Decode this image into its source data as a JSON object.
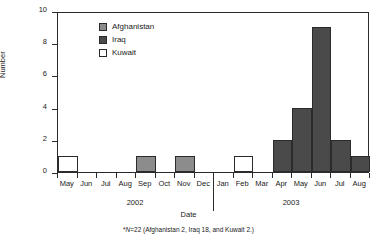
{
  "chart_data": {
    "type": "bar",
    "title": "",
    "xlabel": "Date",
    "ylabel": "Number",
    "ylim": [
      0,
      10
    ],
    "yticks": [
      0,
      2,
      4,
      6,
      8,
      10
    ],
    "grid": false,
    "legend_position": "inside-top-left",
    "categories": [
      "May",
      "Jun",
      "Jul",
      "Aug",
      "Sep",
      "Oct",
      "Nov",
      "Dec",
      "Jan",
      "Feb",
      "Mar",
      "Apr",
      "May",
      "Jun",
      "Jul",
      "Aug"
    ],
    "group_labels": [
      "2002",
      "2003"
    ],
    "series": [
      {
        "name": "Afghanistan",
        "color": "#8c8c8c",
        "values": [
          0,
          0,
          0,
          0,
          1,
          0,
          1,
          0,
          0,
          0,
          0,
          0,
          0,
          0,
          0,
          0
        ]
      },
      {
        "name": "Iraq",
        "color": "#4a4a4a",
        "values": [
          0,
          0,
          0,
          0,
          0,
          0,
          0,
          0,
          0,
          0,
          0,
          2,
          4,
          9,
          2,
          1
        ]
      },
      {
        "name": "Kuwait",
        "color": "#ffffff",
        "values": [
          1,
          0,
          0,
          0,
          0,
          0,
          0,
          0,
          0,
          1,
          0,
          0,
          0,
          0,
          0,
          0
        ]
      }
    ],
    "bars": [
      {
        "month": "May",
        "year": "2002",
        "value": 1,
        "series": "Kuwait",
        "color": "#ffffff"
      },
      {
        "month": "Jun",
        "year": "2002",
        "value": 0,
        "series": "",
        "color": "#ffffff"
      },
      {
        "month": "Jul",
        "year": "2002",
        "value": 0,
        "series": "",
        "color": "#ffffff"
      },
      {
        "month": "Aug",
        "year": "2002",
        "value": 0,
        "series": "",
        "color": "#ffffff"
      },
      {
        "month": "Sep",
        "year": "2002",
        "value": 1,
        "series": "Afghanistan",
        "color": "#8c8c8c"
      },
      {
        "month": "Oct",
        "year": "2002",
        "value": 0,
        "series": "",
        "color": "#ffffff"
      },
      {
        "month": "Nov",
        "year": "2002",
        "value": 1,
        "series": "Afghanistan",
        "color": "#8c8c8c"
      },
      {
        "month": "Dec",
        "year": "2002",
        "value": 0,
        "series": "",
        "color": "#ffffff"
      },
      {
        "month": "Jan",
        "year": "2003",
        "value": 0,
        "series": "",
        "color": "#ffffff"
      },
      {
        "month": "Feb",
        "year": "2003",
        "value": 1,
        "series": "Kuwait",
        "color": "#ffffff"
      },
      {
        "month": "Mar",
        "year": "2003",
        "value": 0,
        "series": "",
        "color": "#ffffff"
      },
      {
        "month": "Apr",
        "year": "2003",
        "value": 2,
        "series": "Iraq",
        "color": "#4a4a4a"
      },
      {
        "month": "May",
        "year": "2003",
        "value": 4,
        "series": "Iraq",
        "color": "#4a4a4a"
      },
      {
        "month": "Jun",
        "year": "2003",
        "value": 9,
        "series": "Iraq",
        "color": "#4a4a4a"
      },
      {
        "month": "Jul",
        "year": "2003",
        "value": 2,
        "series": "Iraq",
        "color": "#4a4a4a"
      },
      {
        "month": "Aug",
        "year": "2003",
        "value": 1,
        "series": "Iraq",
        "color": "#4a4a4a"
      }
    ]
  },
  "legend": {
    "items": [
      {
        "label": "Afghanistan",
        "color": "#8c8c8c"
      },
      {
        "label": "Iraq",
        "color": "#4a4a4a"
      },
      {
        "label": "Kuwait",
        "color": "#ffffff"
      }
    ]
  },
  "axes": {
    "y_title": "Number",
    "x_title": "Date",
    "y_tick_labels": [
      "0",
      "2",
      "4",
      "6",
      "8",
      "10"
    ],
    "x_tick_labels": [
      "May",
      "Jun",
      "Jul",
      "Aug",
      "Sep",
      "Oct",
      "Nov",
      "Dec",
      "Jan",
      "Feb",
      "Mar",
      "Apr",
      "May",
      "Jun",
      "Jul",
      "Aug"
    ],
    "year_labels": [
      "2002",
      "2003"
    ]
  },
  "footnote": {
    "marker": "*",
    "n_italic": "N",
    "text": "=22 (Afghanistan 2, Iraq 18, and Kuwait 2.)"
  },
  "colors": {
    "afghanistan": "#8c8c8c",
    "iraq": "#4a4a4a",
    "kuwait": "#ffffff",
    "axis": "#2b2b2b",
    "text": "#1a1a1a",
    "background": "#ffffff"
  }
}
